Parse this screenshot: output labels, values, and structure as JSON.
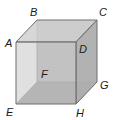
{
  "figure": {
    "type": "cube",
    "colors": {
      "edge": "#6e6e6e",
      "hidden_edge": "#8a8a8a",
      "front_face": "#c4c4c4",
      "top_face": "#cfcfcf",
      "right_face": "#b2b2b2",
      "bottom_face": "#9c9c9c",
      "back_face": "#bdbdbd",
      "label": "#1a1a1a"
    },
    "vertices": {
      "A": {
        "label": "A",
        "x": 16,
        "y": 42
      },
      "B": {
        "label": "B",
        "x": 37,
        "y": 20
      },
      "C": {
        "label": "C",
        "x": 97,
        "y": 20
      },
      "D": {
        "label": "D",
        "x": 76,
        "y": 42
      },
      "E": {
        "label": "E",
        "x": 16,
        "y": 104
      },
      "F": {
        "label": "F",
        "x": 37,
        "y": 82
      },
      "G": {
        "label": "G",
        "x": 97,
        "y": 82
      },
      "H": {
        "label": "H",
        "x": 76,
        "y": 104
      }
    },
    "labels": {
      "A": "A",
      "B": "B",
      "C": "C",
      "D": "D",
      "E": "E",
      "F": "F",
      "G": "G",
      "H": "H"
    }
  }
}
